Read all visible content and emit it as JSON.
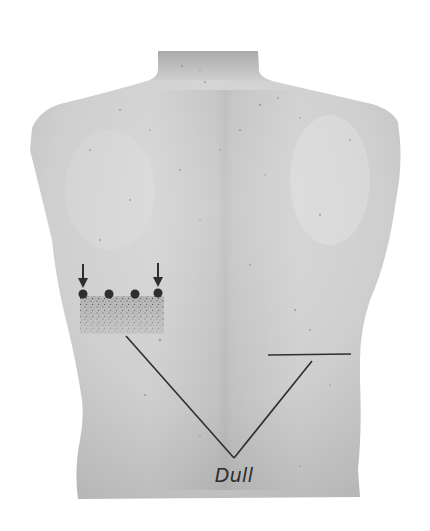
{
  "figure": {
    "annotations": {
      "dull_label": "Dull",
      "arrows": 2,
      "percussion_dots": 4
    },
    "colors": {
      "background": "#ffffff",
      "skin_light": "#d9d9d9",
      "skin_mid": "#c4c4c4",
      "skin_dark": "#a9a9a9",
      "ink": "#2b2b2b"
    }
  }
}
